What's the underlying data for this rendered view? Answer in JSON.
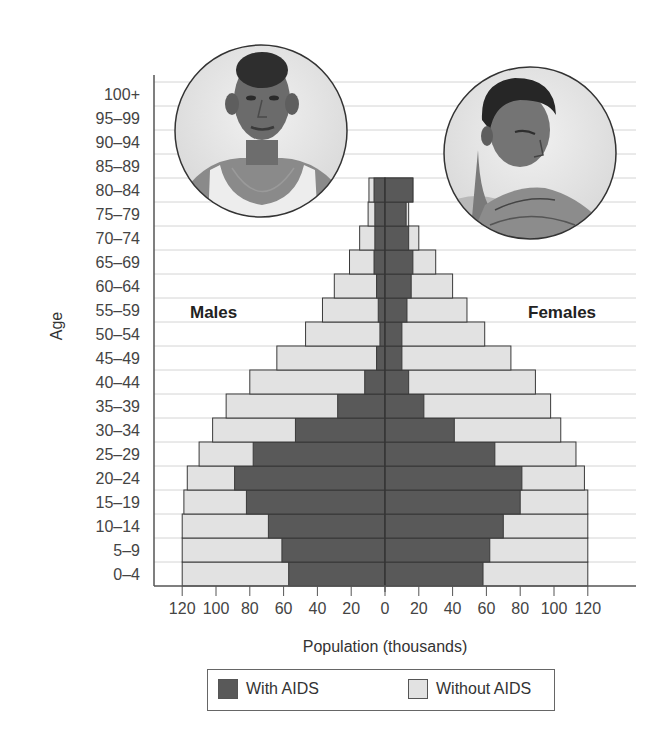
{
  "chart_data": {
    "type": "bar",
    "subtype": "population-pyramid",
    "title": "",
    "xlabel": "Population (thousands)",
    "ylabel": "Age",
    "xlim": [
      -120,
      120
    ],
    "x_ticks": [
      -120,
      -100,
      -80,
      -60,
      -40,
      -20,
      0,
      20,
      40,
      60,
      80,
      100,
      120
    ],
    "x_tick_labels": [
      "120",
      "100",
      "80",
      "60",
      "40",
      "20",
      "0",
      "20",
      "40",
      "60",
      "80",
      "100",
      "120"
    ],
    "grid": "horizontal",
    "legend_position": "bottom",
    "side_labels": {
      "left": "Males",
      "right": "Females"
    },
    "categories": [
      "0–4",
      "5–9",
      "10–14",
      "15–19",
      "20–24",
      "25–29",
      "30–34",
      "35–39",
      "40–44",
      "45–49",
      "50–54",
      "55–59",
      "60–64",
      "65–69",
      "70–74",
      "75–79",
      "80–84",
      "85–89",
      "90–94",
      "95–99",
      "100+"
    ],
    "series": [
      {
        "name": "Males With AIDS",
        "sex": "male",
        "type": "with_aids",
        "values": [
          57,
          61,
          69,
          82,
          89,
          78,
          53,
          28,
          12,
          5,
          3,
          4,
          5,
          6.5,
          6,
          6,
          6.5,
          0,
          0,
          0,
          0
        ]
      },
      {
        "name": "Males Total (With + Without AIDS)",
        "sex": "male",
        "type": "total",
        "values": [
          120,
          120,
          120,
          119,
          117,
          110,
          102,
          94,
          80,
          64,
          47,
          37,
          30,
          21,
          15,
          10,
          9.5,
          0,
          0,
          0,
          0
        ]
      },
      {
        "name": "Females With AIDS",
        "sex": "female",
        "type": "with_aids",
        "values": [
          58,
          62,
          70,
          80,
          81,
          65,
          41,
          23,
          14,
          10,
          10,
          13,
          15.5,
          16.5,
          14,
          12.5,
          16.5,
          0,
          0,
          0,
          0
        ]
      },
      {
        "name": "Females Total (With + Without AIDS)",
        "sex": "female",
        "type": "total",
        "values": [
          120,
          120,
          120,
          120,
          118,
          113,
          104,
          98,
          89,
          74.5,
          59,
          48.5,
          40,
          30,
          20,
          14,
          16.5,
          0,
          0,
          0,
          0
        ]
      }
    ],
    "legend": [
      {
        "label": "With AIDS",
        "color": "#595959"
      },
      {
        "label": "Without AIDS",
        "color": "#e2e2e2"
      }
    ]
  },
  "labels": {
    "ylabel": "Age",
    "xlabel": "Population (thousands)",
    "males": "Males",
    "females": "Females"
  },
  "legend": {
    "with_aids": "With AIDS",
    "without_aids": "Without AIDS"
  },
  "images": {
    "male_portrait": "illustration-male-portrait",
    "female_portrait": "illustration-female-portrait"
  },
  "colors": {
    "with_aids": "#595959",
    "without_aids": "#e2e2e2",
    "bar_outline": "#3a3a3a",
    "gridline": "#d4d4d4",
    "axis": "#555555"
  }
}
